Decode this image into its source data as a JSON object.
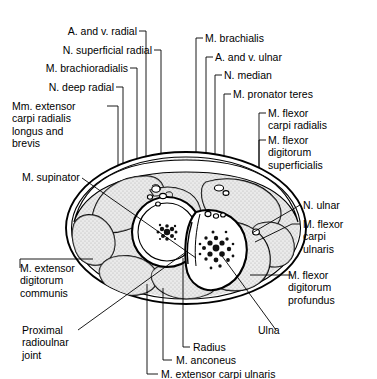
{
  "figure": {
    "type": "anatomical-cross-section",
    "colors": {
      "outline": "#000000",
      "muscle_fill": "#d8d8d8",
      "bone_fill": "#ffffff",
      "marrow": "#1a1a1a",
      "background": "#ffffff",
      "leader": "#000000"
    }
  },
  "labels": {
    "a_and_v_radial": "A. and v. radial",
    "n_superficial_radial": "N. superficial radial",
    "m_brachioradialis": "M. brachioradialis",
    "n_deep_radial": "N. deep radial",
    "mm_extensor_carpi_radialis": "Mm. extensor\ncarpi radialis\nlongus and\nbrevis",
    "m_supinator": "M. supinator",
    "m_extensor_digitorum_communis": "M. extensor\ndigitorum\ncommunis",
    "proximal_radioulnar_joint": "Proximal\nradioulnar\njoint",
    "m_brachialis": "M. brachialis",
    "a_and_v_ulnar": "A. and v. ulnar",
    "n_median": "N. median",
    "m_pronator_teres": "M. pronator teres",
    "m_flexor_carpi_radialis": "M. flexor\ncarpi radialis",
    "m_flexor_digitorum_superficialis": "M. flexor\ndigitorum\nsuperficialis",
    "n_ulnar": "N. ulnar",
    "m_flexor_carpi_ulnaris": "M. flexor\ncarpi\nulnaris",
    "m_flexor_digitorum_profundus": "M. flexor\ndigitorum\nprofundus",
    "radius": "Radius",
    "ulna": "Ulna",
    "m_anconeus": "M. anconeus",
    "m_extensor_carpi_ulnaris": "M. extensor carpi ulnaris"
  }
}
